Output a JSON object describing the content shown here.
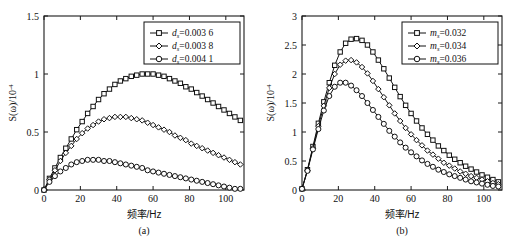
{
  "figure": {
    "panels": [
      {
        "id": "a",
        "caption": "(a)",
        "xlabel": "频率/Hz",
        "ylabel_main": "S(ω)/10",
        "ylabel_exp": "-4",
        "legend": [
          {
            "label_var": "d",
            "label_sub": "s",
            "label_val": "=0.003 6",
            "marker": "square"
          },
          {
            "label_var": "d",
            "label_sub": "s",
            "label_val": "=0.003 8",
            "marker": "diamond"
          },
          {
            "label_var": "d",
            "label_sub": "s",
            "label_val": "=0.004 1",
            "marker": "circle"
          }
        ]
      },
      {
        "id": "b",
        "caption": "(b)",
        "xlabel": "频率/Hz",
        "ylabel_main": "S(ω)/10",
        "ylabel_exp": "-4",
        "legend": [
          {
            "label_var": "m",
            "label_sub": "s",
            "label_val": "=0.032",
            "marker": "square"
          },
          {
            "label_var": "m",
            "label_sub": "s",
            "label_val": "=0.034",
            "marker": "diamond"
          },
          {
            "label_var": "m",
            "label_sub": "s",
            "label_val": "=0.036",
            "marker": "circle"
          }
        ]
      }
    ]
  },
  "chart_data": [
    {
      "type": "line",
      "panel": "a",
      "title": "",
      "xlabel": "频率/Hz",
      "ylabel": "S(ω)/10^-4",
      "xlim": [
        0,
        110
      ],
      "ylim": [
        0,
        1.5
      ],
      "xticks": [
        0,
        20,
        40,
        60,
        80,
        100
      ],
      "yticks": [
        0,
        0.5,
        1,
        1.5
      ],
      "grid": false,
      "legend_position": "top-right",
      "x": [
        0,
        3,
        6,
        9,
        12,
        15,
        18,
        21,
        24,
        27,
        30,
        33,
        36,
        39,
        42,
        45,
        48,
        51,
        54,
        57,
        60,
        63,
        66,
        69,
        72,
        75,
        78,
        81,
        84,
        87,
        90,
        93,
        96,
        99,
        102,
        105,
        108
      ],
      "series": [
        {
          "name": "d_s=0.003 6",
          "marker": "square",
          "values": [
            0.0,
            0.1,
            0.19,
            0.28,
            0.36,
            0.44,
            0.52,
            0.59,
            0.66,
            0.72,
            0.78,
            0.83,
            0.87,
            0.91,
            0.94,
            0.96,
            0.98,
            0.99,
            1.0,
            1.0,
            1.0,
            0.99,
            0.98,
            0.96,
            0.94,
            0.92,
            0.89,
            0.87,
            0.84,
            0.81,
            0.78,
            0.75,
            0.72,
            0.69,
            0.66,
            0.63,
            0.6
          ]
        },
        {
          "name": "d_s=0.003 8",
          "marker": "diamond",
          "values": [
            0.0,
            0.09,
            0.17,
            0.25,
            0.32,
            0.38,
            0.44,
            0.49,
            0.53,
            0.56,
            0.59,
            0.61,
            0.62,
            0.63,
            0.63,
            0.63,
            0.62,
            0.61,
            0.6,
            0.58,
            0.56,
            0.54,
            0.52,
            0.5,
            0.47,
            0.45,
            0.43,
            0.4,
            0.38,
            0.36,
            0.34,
            0.32,
            0.3,
            0.28,
            0.26,
            0.24,
            0.22
          ]
        },
        {
          "name": "d_s=0.004 1",
          "marker": "circle",
          "values": [
            0.0,
            0.07,
            0.12,
            0.16,
            0.19,
            0.22,
            0.24,
            0.25,
            0.26,
            0.26,
            0.26,
            0.25,
            0.25,
            0.24,
            0.23,
            0.22,
            0.21,
            0.2,
            0.19,
            0.17,
            0.16,
            0.15,
            0.14,
            0.13,
            0.12,
            0.11,
            0.1,
            0.09,
            0.08,
            0.07,
            0.06,
            0.05,
            0.04,
            0.03,
            0.02,
            0.01,
            0.01
          ]
        }
      ]
    },
    {
      "type": "line",
      "panel": "b",
      "title": "",
      "xlabel": "频率/Hz",
      "ylabel": "S(ω)/10^-4",
      "xlim": [
        0,
        110
      ],
      "ylim": [
        0,
        3
      ],
      "xticks": [
        0,
        20,
        40,
        60,
        80,
        100
      ],
      "yticks": [
        0,
        0.5,
        1,
        1.5,
        2,
        2.5,
        3
      ],
      "grid": false,
      "legend_position": "top-right",
      "x": [
        0,
        3,
        6,
        9,
        12,
        15,
        18,
        21,
        24,
        27,
        30,
        33,
        36,
        39,
        42,
        45,
        48,
        51,
        54,
        57,
        60,
        63,
        66,
        69,
        72,
        75,
        78,
        81,
        84,
        87,
        90,
        93,
        96,
        99,
        102,
        105,
        108
      ],
      "series": [
        {
          "name": "m_s=0.032",
          "marker": "square",
          "values": [
            0.02,
            0.35,
            0.75,
            1.15,
            1.52,
            1.85,
            2.15,
            2.38,
            2.53,
            2.6,
            2.61,
            2.58,
            2.5,
            2.38,
            2.24,
            2.09,
            1.93,
            1.77,
            1.61,
            1.46,
            1.32,
            1.19,
            1.07,
            0.96,
            0.86,
            0.76,
            0.68,
            0.6,
            0.53,
            0.47,
            0.41,
            0.36,
            0.31,
            0.26,
            0.22,
            0.18,
            0.14
          ]
        },
        {
          "name": "m_s=0.034",
          "marker": "diamond",
          "values": [
            0.02,
            0.34,
            0.72,
            1.1,
            1.45,
            1.76,
            2.0,
            2.16,
            2.23,
            2.24,
            2.2,
            2.12,
            2.01,
            1.88,
            1.74,
            1.6,
            1.46,
            1.32,
            1.19,
            1.07,
            0.96,
            0.86,
            0.77,
            0.68,
            0.61,
            0.54,
            0.47,
            0.42,
            0.37,
            0.32,
            0.28,
            0.24,
            0.21,
            0.18,
            0.15,
            0.12,
            0.1
          ]
        },
        {
          "name": "m_s=0.036",
          "marker": "circle",
          "values": [
            0.02,
            0.33,
            0.7,
            1.05,
            1.37,
            1.62,
            1.78,
            1.85,
            1.85,
            1.8,
            1.72,
            1.62,
            1.5,
            1.38,
            1.26,
            1.14,
            1.02,
            0.92,
            0.82,
            0.73,
            0.65,
            0.58,
            0.51,
            0.45,
            0.4,
            0.35,
            0.31,
            0.27,
            0.24,
            0.21,
            0.18,
            0.15,
            0.13,
            0.11,
            0.09,
            0.07,
            0.06
          ]
        }
      ]
    }
  ]
}
